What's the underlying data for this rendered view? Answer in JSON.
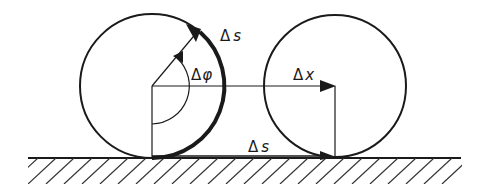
{
  "diagram": {
    "labels": {
      "arc_length_top": {
        "delta": "Δ",
        "var": "s"
      },
      "angle": {
        "delta": "Δ",
        "var": "φ"
      },
      "displacement": {
        "delta": "Δ",
        "var": "x"
      },
      "arc_length_ground": {
        "delta": "Δ",
        "var": "s"
      }
    },
    "elements": {
      "left_wheel": {
        "cx": 152,
        "cy": 86,
        "r": 72
      },
      "right_wheel": {
        "cx": 335,
        "cy": 86,
        "r": 71
      },
      "ground_y": 158
    },
    "colors": {
      "stroke": "#1a1a1a",
      "background": "#ffffff"
    }
  }
}
